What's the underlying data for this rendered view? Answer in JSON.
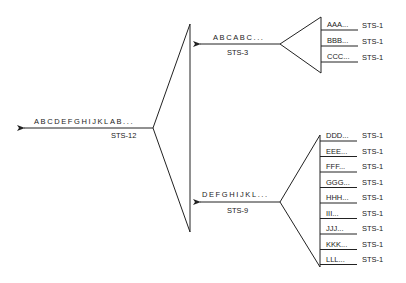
{
  "diagram": {
    "type": "multiplexing-hierarchy",
    "output": {
      "stream": "ABCDEFGHIJKLAB...",
      "rate": "STS-12"
    },
    "mux_top": {
      "output": {
        "stream": "ABCABC...",
        "rate": "STS-3"
      },
      "inputs": [
        {
          "label": "AAA...",
          "rate": "STS-1"
        },
        {
          "label": "BBB...",
          "rate": "STS-1"
        },
        {
          "label": "CCC...",
          "rate": "STS-1"
        }
      ]
    },
    "mux_bottom": {
      "output": {
        "stream": "DEFGHIJKL...",
        "rate": "STS-9"
      },
      "inputs": [
        {
          "label": "DDD...",
          "rate": "STS-1"
        },
        {
          "label": "EEE...",
          "rate": "STS-1"
        },
        {
          "label": "FFF...",
          "rate": "STS-1"
        },
        {
          "label": "GGG...",
          "rate": "STS-1"
        },
        {
          "label": "HHH...",
          "rate": "STS-1"
        },
        {
          "label": "III...",
          "rate": "STS-1"
        },
        {
          "label": "JJJ...",
          "rate": "STS-1"
        },
        {
          "label": "KKK...",
          "rate": "STS-1"
        },
        {
          "label": "LLL...",
          "rate": "STS-1"
        }
      ]
    }
  }
}
